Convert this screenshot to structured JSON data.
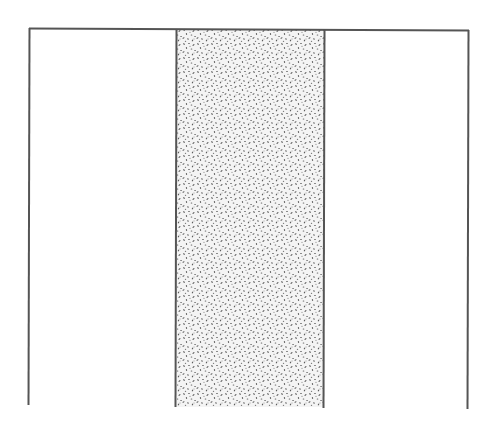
{
  "diagram": {
    "type": "three-compartment schematic",
    "colors": {
      "background": "#ffffff",
      "line": "#555555",
      "stipple_dot": "#5a5a5a",
      "stipple_bg": "#f4f4f4"
    },
    "line_width": 2,
    "outline": {
      "top_left": [
        29,
        28
      ],
      "top_right": [
        468,
        30
      ],
      "left_bottom_y": 405,
      "right_bottom_y": 409
    },
    "compartments": [
      {
        "id": "left",
        "x0": 29,
        "x1": 176,
        "fill": "none"
      },
      {
        "id": "middle",
        "x0": 176,
        "x1": 324,
        "fill": "stipple",
        "bottom_y": 407
      },
      {
        "id": "right",
        "x0": 324,
        "x1": 468,
        "fill": "none"
      }
    ],
    "labels": []
  }
}
